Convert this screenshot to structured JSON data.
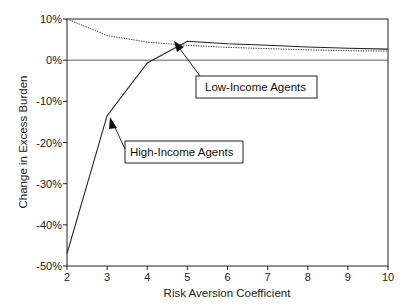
{
  "chart_data": {
    "type": "line",
    "title": "",
    "xlabel": "Risk Aversion Coefficient",
    "ylabel": "Change in Excess Burden",
    "x": [
      2,
      3,
      4,
      5,
      6,
      7,
      8,
      9,
      10
    ],
    "xlim": [
      2,
      10
    ],
    "ylim": [
      -50,
      10
    ],
    "xticks": [
      "2",
      "3",
      "4",
      "5",
      "6",
      "7",
      "8",
      "9",
      "10"
    ],
    "yticks": [
      "10%",
      "0%",
      "-10%",
      "-20%",
      "-30%",
      "-40%",
      "-50%"
    ],
    "grid": false,
    "zero_line": true,
    "series": [
      {
        "name": "High-Income Agents",
        "style": "solid",
        "values": [
          -47,
          -13.5,
          -0.7,
          4.6,
          4.0,
          3.6,
          3.2,
          2.9,
          2.7
        ]
      },
      {
        "name": "Low-Income Agents",
        "style": "dotted",
        "values": [
          10,
          6.0,
          4.4,
          3.6,
          3.1,
          2.8,
          2.5,
          2.3,
          2.2
        ]
      }
    ],
    "annotations": [
      {
        "text": "Low-Income Agents",
        "points_to": "Low-Income Agents"
      },
      {
        "text": "High-Income Agents",
        "points_to": "High-Income Agents"
      }
    ]
  }
}
